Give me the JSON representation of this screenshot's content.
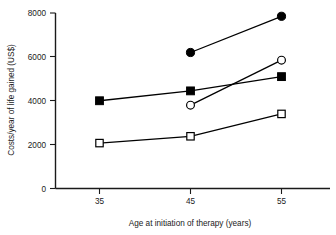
{
  "chart_data": {
    "type": "line",
    "title": "",
    "xlabel": "Age at initiation of therapy (years)",
    "ylabel": "Costs/year of life gained (US$)",
    "x": [
      35,
      45,
      55
    ],
    "xtick_labels": [
      "35",
      "45",
      "55"
    ],
    "ytick_labels": [
      "0",
      "2000",
      "4000",
      "6000",
      "8000"
    ],
    "yticks": [
      0,
      2000,
      4000,
      6000,
      8000
    ],
    "xlim": [
      30,
      60
    ],
    "ylim": [
      0,
      8000
    ],
    "grid": false,
    "legend": "none",
    "series": [
      {
        "name": "filled-circle-series",
        "marker": "filled-circle",
        "x": [
          45,
          55
        ],
        "values": [
          6200,
          7850
        ]
      },
      {
        "name": "open-circle-series",
        "marker": "open-circle",
        "x": [
          45,
          55
        ],
        "values": [
          3800,
          5850
        ]
      },
      {
        "name": "filled-square-series",
        "marker": "filled-square",
        "x": [
          35,
          45,
          55
        ],
        "values": [
          4000,
          4450,
          5100
        ]
      },
      {
        "name": "open-square-series",
        "marker": "open-square",
        "x": [
          35,
          45,
          55
        ],
        "values": [
          2070,
          2380,
          3400
        ]
      }
    ]
  },
  "axes": {
    "x_title": "Age at initiation of therapy (years)",
    "y_title": "Costs/year of life gained (US$)",
    "xticks": [
      "35",
      "45",
      "55"
    ],
    "yticks": [
      "0",
      "2000",
      "4000",
      "6000",
      "8000"
    ]
  },
  "colors": {
    "ink": "#000000",
    "background": "#ffffff"
  }
}
